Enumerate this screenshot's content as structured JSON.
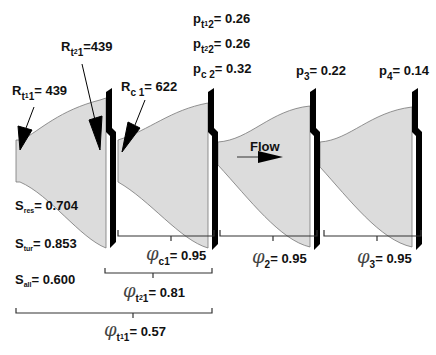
{
  "diagram": {
    "flow_label": "Flow",
    "colors": {
      "nozzle_fill": "#dcdcdc",
      "nozzle_edge": "#777777",
      "baffle": "#000000",
      "text": "#111111"
    },
    "R_labels": [
      {
        "sym": "R",
        "sub": "t",
        "subsub": "1",
        "tail": "1",
        "value": "= 439"
      },
      {
        "sym": "R",
        "sub": "t",
        "subsub": "2",
        "tail": "1",
        "value": "=439"
      },
      {
        "sym": "R",
        "sub": "c",
        "subsub": "",
        "tail": " 1",
        "value": "= 622"
      }
    ],
    "p_labels": [
      {
        "sym": "p",
        "sub": "t",
        "subsub": "1",
        "tail": "2",
        "value": "= 0.26"
      },
      {
        "sym": "p",
        "sub": "t",
        "subsub": "2",
        "tail": "2",
        "value": "= 0.26"
      },
      {
        "sym": "p",
        "sub": "c",
        "subsub": "",
        "tail": " 2",
        "value": "= 0.32"
      },
      {
        "sym": "p",
        "sub": "3",
        "subsub": "",
        "tail": "",
        "value": "= 0.22"
      },
      {
        "sym": "p",
        "sub": "4",
        "subsub": "",
        "tail": "",
        "value": "= 0.14"
      }
    ],
    "S_labels": [
      {
        "sym": "S",
        "sub": "res",
        "value": "= 0.704"
      },
      {
        "sym": "S",
        "sub": "tur",
        "value": "= 0.853"
      },
      {
        "sym": "S",
        "sub": "all",
        "value": "= 0.600"
      }
    ],
    "phi_labels": [
      {
        "sym": "φ",
        "sub": "c1",
        "subsub": "",
        "value": "= 0.95"
      },
      {
        "sym": "φ",
        "sub": "2",
        "subsub": "",
        "value": "= 0.95"
      },
      {
        "sym": "φ",
        "sub": "3",
        "subsub": "",
        "value": "= 0.95"
      },
      {
        "sym": "φ",
        "sub": "t",
        "subsub": "2",
        "tail": "1",
        "value": "= 0.81"
      },
      {
        "sym": "φ",
        "sub": "t",
        "subsub": "1",
        "tail": "1",
        "value": "= 0.57"
      }
    ]
  }
}
